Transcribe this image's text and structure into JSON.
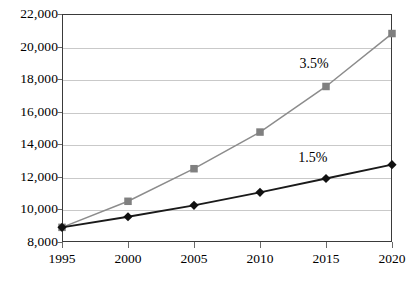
{
  "chart_data": {
    "type": "line",
    "title": "",
    "subtitle": "",
    "xlabel": "",
    "ylabel": "",
    "x": [
      1995,
      2000,
      2005,
      2010,
      2015,
      2020
    ],
    "categories": [
      "1995",
      "2000",
      "2005",
      "2010",
      "2015",
      "2020"
    ],
    "xlim": [
      1995,
      2020
    ],
    "ylim": [
      8000,
      22000
    ],
    "ytick_values": [
      8000,
      10000,
      12000,
      14000,
      16000,
      18000,
      20000,
      22000
    ],
    "ytick_labels": [
      "8,000",
      "10,000",
      "12,000",
      "14,000",
      "16,000",
      "18,000",
      "20,000",
      "22,000"
    ],
    "xtick_labels": [
      "1995",
      "2000",
      "2005",
      "2010",
      "2015",
      "2020"
    ],
    "grid": true,
    "grid_axis": "y",
    "legend": false,
    "legend_position": "none",
    "series": [
      {
        "name": "3.5%",
        "values": [
          8900,
          10500,
          12500,
          14750,
          17550,
          20800
        ],
        "color": "#8c8c8c",
        "marker": "square",
        "marker_color": "#808080",
        "annotation": "3.5%"
      },
      {
        "name": "1.5%",
        "values": [
          8900,
          9550,
          10250,
          11050,
          11900,
          12750
        ],
        "color": "#1a1a1a",
        "marker": "diamond",
        "marker_color": "#111111",
        "annotation": "1.5%"
      }
    ],
    "annotations": [
      {
        "text": "3.5%",
        "x": 2014.1,
        "y": 18950
      },
      {
        "text": "1.5%",
        "x": 2014.0,
        "y": 13150
      }
    ]
  },
  "style": {
    "plot_border_color": "#3a3a3a",
    "gridline_color": "#c9c9c9",
    "background": "#ffffff",
    "text_color": "#000000"
  }
}
